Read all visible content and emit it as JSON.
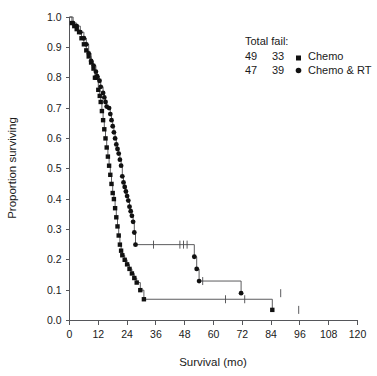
{
  "chart_data": {
    "type": "line",
    "title": "",
    "xlabel": "Survival (mo)",
    "ylabel": "Proportion surviving",
    "xlim": [
      0,
      120
    ],
    "ylim": [
      0.0,
      1.0
    ],
    "xticks": [
      0,
      12,
      24,
      36,
      48,
      60,
      72,
      84,
      96,
      108,
      120
    ],
    "yticks": [
      "0.0",
      "0.1",
      "0.2",
      "0.3",
      "0.4",
      "0.5",
      "0.6",
      "0.7",
      "0.8",
      "0.9",
      "1.0"
    ],
    "xtick_labels": [
      "0",
      "12",
      "24",
      "36",
      "48",
      "60",
      "72",
      "84",
      "96",
      "108",
      "120"
    ],
    "grid": false,
    "legend_position": "top-right",
    "legend_title": "Total fail:",
    "series": [
      {
        "name": "Chemo",
        "marker": "square",
        "total": 49,
        "fail": 33,
        "points": [
          [
            0,
            1.0
          ],
          [
            1,
            0.98
          ],
          [
            2,
            0.97
          ],
          [
            3,
            0.96
          ],
          [
            4,
            0.95
          ],
          [
            5,
            0.93
          ],
          [
            6,
            0.91
          ],
          [
            7,
            0.89
          ],
          [
            8,
            0.87
          ],
          [
            9,
            0.85
          ],
          [
            10,
            0.83
          ],
          [
            10.6,
            0.8
          ],
          [
            11.2,
            0.8
          ],
          [
            12,
            0.76
          ],
          [
            12.6,
            0.74
          ],
          [
            13,
            0.72
          ],
          [
            13.5,
            0.69
          ],
          [
            14,
            0.66
          ],
          [
            14.5,
            0.63
          ],
          [
            15,
            0.6
          ],
          [
            15.5,
            0.57
          ],
          [
            16,
            0.54
          ],
          [
            16.5,
            0.51
          ],
          [
            17,
            0.48
          ],
          [
            17.5,
            0.45
          ],
          [
            18,
            0.42
          ],
          [
            18.5,
            0.4
          ],
          [
            19,
            0.37
          ],
          [
            19.5,
            0.34
          ],
          [
            20,
            0.31
          ],
          [
            20.5,
            0.28
          ],
          [
            21,
            0.25
          ],
          [
            21.5,
            0.23
          ],
          [
            22,
            0.215
          ],
          [
            23,
            0.2
          ],
          [
            24,
            0.185
          ],
          [
            25,
            0.17
          ],
          [
            26,
            0.155
          ],
          [
            27,
            0.14
          ],
          [
            28,
            0.125
          ],
          [
            29.5,
            0.1
          ],
          [
            31,
            0.07
          ],
          [
            84.5,
            0.035
          ]
        ],
        "censored": [
          65,
          73,
          95.5
        ]
      },
      {
        "name": "Chemo & RT",
        "marker": "circle",
        "total": 47,
        "fail": 39,
        "points": [
          [
            0,
            1.0
          ],
          [
            1.5,
            0.98
          ],
          [
            3,
            0.97
          ],
          [
            4.5,
            0.95
          ],
          [
            6,
            0.93
          ],
          [
            7,
            0.91
          ],
          [
            8,
            0.88
          ],
          [
            9,
            0.855
          ],
          [
            10,
            0.84
          ],
          [
            11,
            0.82
          ],
          [
            11.5,
            0.805
          ],
          [
            12.5,
            0.79
          ],
          [
            13,
            0.77
          ],
          [
            14,
            0.75
          ],
          [
            14.5,
            0.735
          ],
          [
            15,
            0.72
          ],
          [
            15.5,
            0.705
          ],
          [
            16.5,
            0.7
          ],
          [
            17,
            0.68
          ],
          [
            17.5,
            0.66
          ],
          [
            18,
            0.64
          ],
          [
            18.5,
            0.62
          ],
          [
            19,
            0.6
          ],
          [
            19.5,
            0.58
          ],
          [
            20,
            0.565
          ],
          [
            20.5,
            0.55
          ],
          [
            21,
            0.53
          ],
          [
            21.5,
            0.51
          ],
          [
            22,
            0.475
          ],
          [
            22.5,
            0.455
          ],
          [
            23,
            0.44
          ],
          [
            23.5,
            0.425
          ],
          [
            24,
            0.41
          ],
          [
            24.5,
            0.395
          ],
          [
            25,
            0.375
          ],
          [
            25.5,
            0.36
          ],
          [
            26,
            0.345
          ],
          [
            26.5,
            0.325
          ],
          [
            27,
            0.29
          ],
          [
            27.5,
            0.25
          ],
          [
            52,
            0.21
          ],
          [
            53,
            0.17
          ],
          [
            54,
            0.13
          ],
          [
            71.5,
            0.09
          ]
        ],
        "censored": [
          35,
          46,
          47.5,
          49,
          55.5,
          88
        ]
      }
    ],
    "legend_entries": [
      {
        "total": "49",
        "fail": "33",
        "label": "Chemo",
        "marker": "square"
      },
      {
        "total": "47",
        "fail": "39",
        "label": "Chemo & RT",
        "marker": "circle"
      }
    ]
  },
  "colors": {
    "line": "#4a4a4c",
    "marker": "#111111",
    "axis": "#55565a",
    "text": "#1a1a1a",
    "background": "#ffffff"
  }
}
